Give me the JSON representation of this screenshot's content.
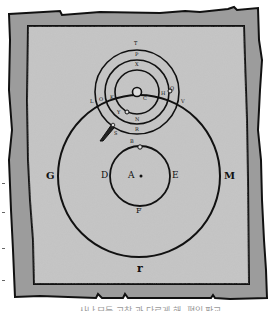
{
  "figure": {
    "type": "geocentric epicycle diagram on parchment",
    "colors": {
      "frame": "#9c9c9c",
      "parchment": "#c4c4c4",
      "ink": "#111111",
      "background": "#ffffff"
    },
    "labels": {
      "outer_left": "G",
      "outer_right": "M",
      "outer_bottom": "r",
      "inner_left": "D",
      "inner_right": "E",
      "inner_bottom": "F",
      "center": "A",
      "epicycle_top_outer": "T",
      "epicycle_top_mid": "P",
      "epicycle_top_inner": "X",
      "epicycle_center": "C",
      "epicycle_left": "L",
      "epicycle_left2": "O",
      "epicycle_left3": "K",
      "epicycle_bottom_inner": "N",
      "epicycle_bottom_mid": "R",
      "epicycle_bottom_outer": "B",
      "epicycle_right": "H",
      "epicycle_right2": "Q",
      "epicycle_right3": "V",
      "pencil_label": "S",
      "small_circle_label": "Y"
    },
    "caption": "...사나 모든 고찰 과 다르게 해, 편입 판교"
  }
}
